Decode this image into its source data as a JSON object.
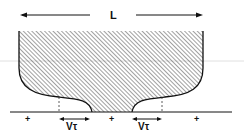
{
  "diagram": {
    "length_label": "L",
    "velocity_labels": [
      "Vτ",
      "Vτ"
    ],
    "charge_marks": [
      "+",
      "+",
      "+"
    ],
    "colors": {
      "ink": "#111111",
      "hatch": "#444444",
      "guide_line": "#cccccc",
      "background": "#ffffff"
    }
  }
}
